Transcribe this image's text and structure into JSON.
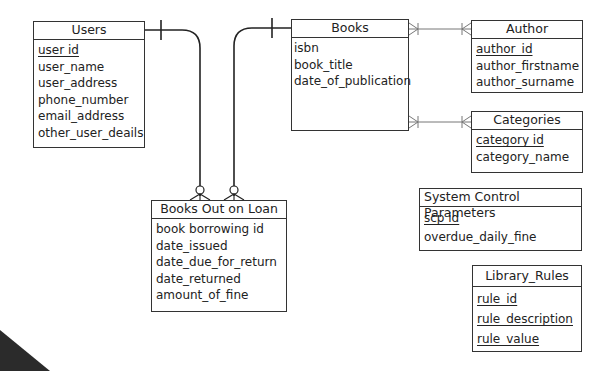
{
  "diagram": {
    "type": "entity-relationship",
    "entities": [
      {
        "id": "users",
        "title": "Users",
        "attributes": [
          {
            "name": "user id",
            "pk": true
          },
          {
            "name": "user_name",
            "pk": false
          },
          {
            "name": "user_address",
            "pk": false
          },
          {
            "name": "phone_number",
            "pk": false
          },
          {
            "name": "email_address",
            "pk": false
          },
          {
            "name": "other_user_deails",
            "pk": false
          }
        ]
      },
      {
        "id": "books",
        "title": "Books",
        "attributes": [
          {
            "name": "isbn",
            "pk": false
          },
          {
            "name": "book_title",
            "pk": false
          },
          {
            "name": "date_of_publication",
            "pk": false
          }
        ]
      },
      {
        "id": "author",
        "title": "Author",
        "attributes": [
          {
            "name": "author_id",
            "pk": true
          },
          {
            "name": "author_firstname",
            "pk": false
          },
          {
            "name": "author_surname",
            "pk": false
          }
        ]
      },
      {
        "id": "categories",
        "title": "Categories",
        "attributes": [
          {
            "name": "category id",
            "pk": true
          },
          {
            "name": "category_name",
            "pk": false
          }
        ]
      },
      {
        "id": "loan",
        "title": "Books Out on Loan",
        "attributes": [
          {
            "name": "book borrowing id",
            "pk": false
          },
          {
            "name": "date_issued",
            "pk": false
          },
          {
            "name": "date_due_for_return",
            "pk": false
          },
          {
            "name": "date_returned",
            "pk": false
          },
          {
            "name": "amount_of_fine",
            "pk": false
          }
        ]
      },
      {
        "id": "scp",
        "title": "System Control Parameters",
        "attributes": [
          {
            "name": "scp id",
            "pk": true
          },
          {
            "name": "overdue_daily_fine",
            "pk": false
          }
        ]
      },
      {
        "id": "rules",
        "title": "Library_Rules",
        "attributes": [
          {
            "name": "rule_id",
            "pk": true
          },
          {
            "name": "rule_description",
            "pk": true
          },
          {
            "name": "rule_value",
            "pk": true
          }
        ]
      }
    ],
    "relationships": [
      {
        "from": "users",
        "to": "loan",
        "from_card": "one",
        "to_card": "zero-or-many"
      },
      {
        "from": "books",
        "to": "loan",
        "from_card": "one",
        "to_card": "zero-or-many"
      },
      {
        "from": "books",
        "to": "author",
        "from_card": "many",
        "to_card": "many"
      },
      {
        "from": "books",
        "to": "categories",
        "from_card": "many",
        "to_card": "many"
      }
    ]
  }
}
